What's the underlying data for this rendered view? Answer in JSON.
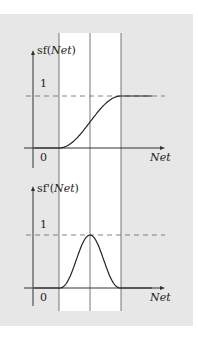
{
  "chart_data": [
    {
      "type": "line",
      "title": "",
      "ylabel": "sf(Net)",
      "ylabel_func": "sf",
      "ylabel_arg": "Net",
      "xlabel": "Net",
      "y_ticks": [
        {
          "value": 1,
          "label": "1"
        }
      ],
      "origin_label": "0",
      "xlim": [
        -6,
        6
      ],
      "ylim": [
        0,
        1
      ],
      "reference_lines": {
        "horizontal_dashed": 1,
        "vertical": [
          -3,
          0,
          3
        ]
      },
      "series": [
        {
          "name": "sigmoid",
          "function": "sf(Net) = 1/(1+e^(-Net))",
          "x": [
            -6,
            -3,
            -2,
            -1,
            0,
            1,
            2,
            3,
            6
          ],
          "y": [
            0,
            0.02,
            0.12,
            0.27,
            0.5,
            0.73,
            0.88,
            0.98,
            1
          ]
        }
      ]
    },
    {
      "type": "line",
      "title": "",
      "ylabel": "sf'(Net)",
      "ylabel_func": "sf'",
      "ylabel_arg": "Net",
      "xlabel": "Net",
      "y_ticks": [
        {
          "value": 1,
          "label": "1"
        }
      ],
      "origin_label": "0",
      "xlim": [
        -6,
        6
      ],
      "ylim": [
        0,
        1
      ],
      "reference_lines": {
        "horizontal_dashed": 1,
        "vertical": [
          -3,
          0,
          3
        ]
      },
      "series": [
        {
          "name": "sigmoid-derivative",
          "function": "bell-shaped derivative, peak at Net=0",
          "x": [
            -6,
            -3,
            -2,
            -1,
            0,
            1,
            2,
            3,
            6
          ],
          "y": [
            0,
            0,
            0.1,
            0.55,
            1,
            0.55,
            0.1,
            0,
            0
          ]
        }
      ]
    }
  ]
}
